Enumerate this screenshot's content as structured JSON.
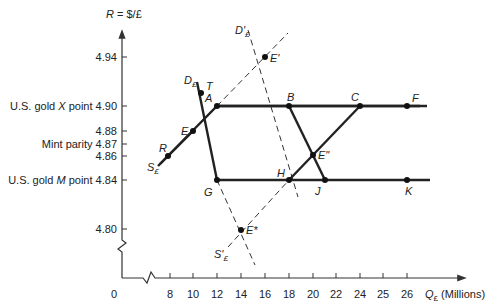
{
  "diagram": {
    "y_axis_title": "R = $/£",
    "x_axis_title": "Q£ (Millions)",
    "x_axis_title_parts": {
      "q": "Q",
      "sub": "£",
      "rest": " (Millions)"
    },
    "origin_label": "0",
    "y_ticks": [
      {
        "value": "4.94",
        "label": "4.94",
        "y": 57
      },
      {
        "value": "4.90",
        "label": "U.S. gold X point 4.90",
        "prefix": "U.S. gold ",
        "ital": "X",
        "suffix": " point 4.90",
        "y": 106
      },
      {
        "value": "4.88",
        "label": "4.88",
        "y": 131
      },
      {
        "value": "4.87",
        "label": "Mint parity 4.87",
        "y": 144
      },
      {
        "value": "4.86",
        "label": "4.86",
        "y": 156
      },
      {
        "value": "4.84",
        "label": "U.S. gold M point 4.84",
        "prefix": "U.S. gold ",
        "ital": "M",
        "suffix": " point 4.84",
        "y": 180
      },
      {
        "value": "4.80",
        "label": "4.80",
        "y": 229
      }
    ],
    "x_ticks": [
      {
        "label": "8",
        "x": 170
      },
      {
        "label": "10",
        "x": 193
      },
      {
        "label": "12",
        "x": 217
      },
      {
        "label": "14",
        "x": 241
      },
      {
        "label": "16",
        "x": 265
      },
      {
        "label": "18",
        "x": 289
      },
      {
        "label": "20",
        "x": 313
      },
      {
        "label": "22",
        "x": 336
      },
      {
        "label": "24",
        "x": 360
      },
      {
        "label": "25",
        "x": 383
      },
      {
        "label": "26",
        "x": 407
      }
    ],
    "points": {
      "A": {
        "label": "A",
        "x": 217,
        "y": 106
      },
      "B": {
        "label": "B",
        "x": 289,
        "y": 106
      },
      "C": {
        "label": "C",
        "x": 360,
        "y": 106
      },
      "F": {
        "label": "F",
        "x": 407,
        "y": 106
      },
      "G": {
        "label": "G",
        "x": 217,
        "y": 180
      },
      "H": {
        "label": "H",
        "x": 289,
        "y": 180
      },
      "J": {
        "label": "J",
        "x": 325,
        "y": 180
      },
      "K": {
        "label": "K",
        "x": 407,
        "y": 180
      },
      "E": {
        "label": "E",
        "x": 193,
        "y": 131
      },
      "R": {
        "label": "R",
        "x": 168,
        "y": 156
      },
      "T": {
        "label": "T",
        "x": 201,
        "y": 93
      },
      "E1": {
        "label": "E'",
        "x": 265,
        "y": 57
      },
      "E2": {
        "label": "E\"",
        "x": 313,
        "y": 155
      },
      "E3": {
        "label": "E*",
        "x": 241,
        "y": 230
      }
    },
    "curve_labels": {
      "D": {
        "main": "D",
        "sub": "£"
      },
      "S": {
        "main": "S",
        "sub": "£"
      },
      "D_prime": {
        "main": "D'",
        "sub": "£"
      },
      "S_prime": {
        "main": "S'",
        "sub": "£"
      }
    }
  }
}
